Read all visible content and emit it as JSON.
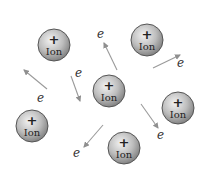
{
  "diagram": {
    "title": "",
    "colors": {
      "background": "#ffffff",
      "ion_fill_light": "#e2e2e2",
      "ion_fill_dark": "#8a8a8a",
      "ion_stroke": "#555555",
      "arrow": "#9a9a9a",
      "text": "#222222"
    },
    "ions": [
      {
        "id": "ion-1",
        "sign": "+",
        "label": "Ion",
        "cx": 54,
        "cy": 45,
        "r": 16
      },
      {
        "id": "ion-2",
        "sign": "+",
        "label": "Ion",
        "cx": 147,
        "cy": 40,
        "r": 16
      },
      {
        "id": "ion-3",
        "sign": "+",
        "label": "Ion",
        "cx": 109,
        "cy": 91,
        "r": 16
      },
      {
        "id": "ion-4",
        "sign": "+",
        "label": "Ion",
        "cx": 178,
        "cy": 108,
        "r": 16
      },
      {
        "id": "ion-5",
        "sign": "+",
        "label": "Ion",
        "cx": 32,
        "cy": 126,
        "r": 16
      },
      {
        "id": "ion-6",
        "sign": "+",
        "label": "Ion",
        "cx": 124,
        "cy": 148,
        "r": 16
      }
    ],
    "electrons": [
      {
        "id": "e-1",
        "label": "e",
        "lx": 97,
        "ly": 38,
        "x1": 117,
        "y1": 70,
        "x2": 104,
        "y2": 43
      },
      {
        "id": "e-2",
        "label": "e",
        "lx": 75,
        "ly": 77,
        "x1": 71,
        "y1": 76,
        "x2": 80,
        "y2": 101
      },
      {
        "id": "e-3",
        "label": "e",
        "lx": 37,
        "ly": 102,
        "x1": 47,
        "y1": 89,
        "x2": 24,
        "y2": 70
      },
      {
        "id": "e-4",
        "label": "e",
        "lx": 177,
        "ly": 67,
        "x1": 153,
        "y1": 68,
        "x2": 180,
        "y2": 55
      },
      {
        "id": "e-5",
        "label": "e",
        "lx": 157,
        "ly": 139,
        "x1": 141,
        "y1": 104,
        "x2": 158,
        "y2": 128
      },
      {
        "id": "e-6",
        "label": "e",
        "lx": 73,
        "ly": 157,
        "x1": 103,
        "y1": 125,
        "x2": 84,
        "y2": 147
      }
    ]
  }
}
